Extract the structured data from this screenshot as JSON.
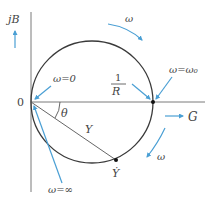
{
  "diagram": {
    "colors": {
      "axis": "#7a7a7a",
      "circle": "#3a3a3a",
      "arrow": "#4a9fd4",
      "text": "#444444",
      "point": "#111111"
    },
    "axes": {
      "vertical_label": "jB",
      "horizontal_label": "G",
      "origin_label": "0"
    },
    "labels": {
      "omega_zero": "ω=0",
      "omega_resonance": "ω=ω₀",
      "omega_infinity": "ω=∞",
      "omega_top": "ω",
      "omega_right": "ω",
      "conductance_num": "1",
      "conductance_den": "R",
      "angle": "θ",
      "phasor": "Y",
      "point": "Ẏ"
    },
    "arrows": [
      {
        "name": "jB-direction-arrow"
      },
      {
        "name": "G-direction-arrow"
      },
      {
        "name": "omega-top-arrow"
      },
      {
        "name": "omega-right-arrow"
      },
      {
        "name": "omega-zero-pointer"
      },
      {
        "name": "omega-resonance-pointer"
      },
      {
        "name": "inverse-R-pointer"
      },
      {
        "name": "omega-infinity-pointer"
      }
    ]
  }
}
